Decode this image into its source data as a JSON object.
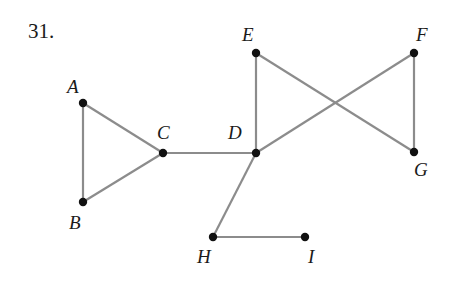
{
  "problem_number": "31.",
  "colors": {
    "edge": "#8c8c8c",
    "vertex": "#111111",
    "label": "#1a1a1a"
  },
  "vertices": [
    {
      "id": "A",
      "label": "A",
      "x": 83,
      "y": 103,
      "lx": 67,
      "ly": 93
    },
    {
      "id": "B",
      "label": "B",
      "x": 83,
      "y": 202,
      "lx": 69,
      "ly": 229
    },
    {
      "id": "C",
      "label": "C",
      "x": 163,
      "y": 153,
      "lx": 157,
      "ly": 139
    },
    {
      "id": "D",
      "label": "D",
      "x": 256,
      "y": 153,
      "lx": 228,
      "ly": 139
    },
    {
      "id": "E",
      "label": "E",
      "x": 256,
      "y": 53,
      "lx": 242,
      "ly": 41
    },
    {
      "id": "F",
      "label": "F",
      "x": 414,
      "y": 53,
      "lx": 416,
      "ly": 41
    },
    {
      "id": "G",
      "label": "G",
      "x": 414,
      "y": 152,
      "lx": 414,
      "ly": 176
    },
    {
      "id": "H",
      "label": "H",
      "x": 213,
      "y": 237,
      "lx": 197,
      "ly": 263
    },
    {
      "id": "I",
      "label": "I",
      "x": 305,
      "y": 237,
      "lx": 308,
      "ly": 263
    }
  ],
  "edges": [
    [
      "A",
      "B"
    ],
    [
      "A",
      "C"
    ],
    [
      "B",
      "C"
    ],
    [
      "C",
      "D"
    ],
    [
      "D",
      "E"
    ],
    [
      "D",
      "F"
    ],
    [
      "E",
      "G"
    ],
    [
      "F",
      "G"
    ],
    [
      "D",
      "H"
    ],
    [
      "H",
      "I"
    ]
  ]
}
